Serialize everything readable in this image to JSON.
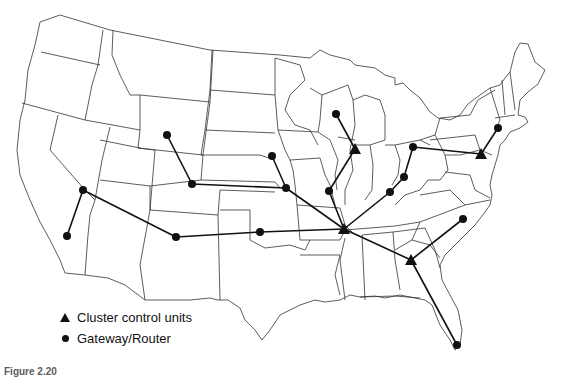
{
  "map": {
    "title": "US network map: cluster control units and gateway/routers",
    "colors": {
      "border": "#333333",
      "link": "#111111",
      "node": "#111111",
      "background": "#ffffff"
    },
    "cluster_control_units": [
      {
        "id": "ccu-illinois",
        "x": 355,
        "y": 149
      },
      {
        "id": "ccu-tennessee",
        "x": 344,
        "y": 229
      },
      {
        "id": "ccu-georgia",
        "x": 411,
        "y": 260
      },
      {
        "id": "ccu-pennsylvania",
        "x": 481,
        "y": 154
      }
    ],
    "gateways": [
      {
        "id": "gw-wyoming",
        "x": 167,
        "y": 135
      },
      {
        "id": "gw-colorado",
        "x": 192,
        "y": 184
      },
      {
        "id": "gw-nebraska-n",
        "x": 272,
        "y": 156
      },
      {
        "id": "gw-kansas",
        "x": 286,
        "y": 188
      },
      {
        "id": "gw-wisconsin",
        "x": 336,
        "y": 114
      },
      {
        "id": "gw-missouri",
        "x": 329,
        "y": 191
      },
      {
        "id": "gw-ohio",
        "x": 413,
        "y": 147
      },
      {
        "id": "gw-kentucky-n",
        "x": 404,
        "y": 177
      },
      {
        "id": "gw-kentucky-s",
        "x": 390,
        "y": 192
      },
      {
        "id": "gw-connecticut",
        "x": 498,
        "y": 128
      },
      {
        "id": "gw-nevada",
        "x": 83,
        "y": 190
      },
      {
        "id": "gw-california",
        "x": 67,
        "y": 236
      },
      {
        "id": "gw-new-mexico",
        "x": 176,
        "y": 237
      },
      {
        "id": "gw-oklahoma",
        "x": 260,
        "y": 232
      },
      {
        "id": "gw-north-carolina",
        "x": 463,
        "y": 219
      },
      {
        "id": "gw-florida",
        "x": 457,
        "y": 345
      }
    ],
    "links": [
      [
        "gw-wyoming",
        "gw-colorado"
      ],
      [
        "gw-colorado",
        "gw-kansas"
      ],
      [
        "gw-nebraska-n",
        "gw-kansas"
      ],
      [
        "gw-kansas",
        "ccu-tennessee"
      ],
      [
        "gw-wisconsin",
        "ccu-illinois"
      ],
      [
        "ccu-illinois",
        "gw-missouri"
      ],
      [
        "gw-missouri",
        "ccu-tennessee"
      ],
      [
        "gw-ohio",
        "gw-kentucky-n"
      ],
      [
        "gw-kentucky-n",
        "gw-kentucky-s"
      ],
      [
        "gw-kentucky-s",
        "ccu-tennessee"
      ],
      [
        "gw-ohio",
        "ccu-pennsylvania"
      ],
      [
        "ccu-pennsylvania",
        "gw-connecticut"
      ],
      [
        "gw-california",
        "gw-nevada"
      ],
      [
        "gw-nevada",
        "gw-new-mexico"
      ],
      [
        "gw-new-mexico",
        "gw-oklahoma"
      ],
      [
        "gw-oklahoma",
        "ccu-tennessee"
      ],
      [
        "ccu-tennessee",
        "ccu-georgia"
      ],
      [
        "ccu-georgia",
        "gw-north-carolina"
      ],
      [
        "ccu-georgia",
        "gw-florida"
      ]
    ]
  },
  "legend": {
    "items": [
      {
        "symbol": "triangle",
        "label": "Cluster control units"
      },
      {
        "symbol": "circle",
        "label": "Gateway/Router"
      }
    ]
  },
  "caption": "Figure 2.20"
}
